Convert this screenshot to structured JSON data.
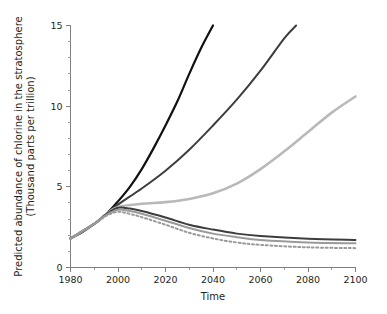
{
  "chart_data": {
    "type": "line",
    "title": "",
    "xlabel": "Time",
    "ylabel": "Predicted abundance of chlorine in the stratosphere (Thousand parts per trillion)",
    "ylabel_line1": "Predicted abundance of chlorine in the stratosphere",
    "ylabel_line2": "(Thousand parts per trillion)",
    "xlim": [
      1980,
      2100
    ],
    "ylim": [
      0,
      15
    ],
    "xticks": [
      1980,
      2000,
      2020,
      2040,
      2060,
      2080,
      2100
    ],
    "xtick_labels": [
      "1980",
      "2000",
      "2020",
      "2040",
      "2060",
      "2080",
      "2100"
    ],
    "xticks_minor": [
      1990,
      2010,
      2030,
      2050,
      2070,
      2090
    ],
    "yticks": [
      0,
      5,
      10,
      15
    ],
    "ytick_labels": [
      "0",
      "5",
      "10",
      "15"
    ],
    "yticks_minor": [
      1,
      2,
      3,
      4,
      6,
      7,
      8,
      9,
      11,
      12,
      13,
      14
    ],
    "grid": false,
    "legend": "none",
    "series": [
      {
        "name": "no-protocol",
        "color": "#111111",
        "width": 2.2,
        "dash": "none",
        "x": [
          1980,
          1985,
          1990,
          1995,
          2000,
          2005,
          2010,
          2015,
          2020,
          2025,
          2030,
          2035,
          2040
        ],
        "values": [
          1.8,
          2.2,
          2.7,
          3.3,
          4.1,
          5.0,
          6.1,
          7.4,
          8.8,
          10.3,
          12.0,
          13.6,
          15.0
        ]
      },
      {
        "name": "no-protocol-lower",
        "color": "#3d3d3d",
        "width": 2.0,
        "dash": "none",
        "x": [
          1980,
          1990,
          1995,
          2000,
          2010,
          2020,
          2030,
          2040,
          2050,
          2060,
          2070,
          2075
        ],
        "values": [
          1.8,
          2.7,
          3.3,
          3.9,
          4.9,
          6.0,
          7.3,
          8.8,
          10.4,
          12.2,
          14.2,
          15.0
        ]
      },
      {
        "name": "montreal-1987",
        "color": "#b9b9b9",
        "width": 2.6,
        "dash": "none",
        "x": [
          1980,
          1990,
          1995,
          2000,
          2010,
          2020,
          2030,
          2040,
          2050,
          2060,
          2070,
          2080,
          2090,
          2100
        ],
        "values": [
          1.8,
          2.7,
          3.3,
          3.75,
          3.95,
          4.05,
          4.25,
          4.6,
          5.2,
          6.1,
          7.2,
          8.4,
          9.6,
          10.6
        ]
      },
      {
        "name": "london-1990",
        "color": "#3d3d3d",
        "width": 2.0,
        "dash": "none",
        "x": [
          1980,
          1990,
          1995,
          2000,
          2005,
          2010,
          2020,
          2030,
          2040,
          2050,
          2060,
          2080,
          2100
        ],
        "values": [
          1.8,
          2.7,
          3.3,
          3.7,
          3.65,
          3.5,
          3.1,
          2.65,
          2.35,
          2.1,
          1.95,
          1.78,
          1.7
        ]
      },
      {
        "name": "copenhagen-1992",
        "color": "#9a9a9a",
        "width": 2.0,
        "dash": "none",
        "x": [
          1980,
          1990,
          1995,
          2000,
          2005,
          2010,
          2020,
          2030,
          2040,
          2050,
          2060,
          2080,
          2100
        ],
        "values": [
          1.8,
          2.7,
          3.25,
          3.58,
          3.5,
          3.33,
          2.9,
          2.45,
          2.1,
          1.88,
          1.7,
          1.55,
          1.5
        ]
      },
      {
        "name": "zero-emissions",
        "color": "#9a9a9a",
        "width": 2.0,
        "dash": "2,2.6",
        "x": [
          1980,
          1990,
          1995,
          2000,
          2005,
          2010,
          2020,
          2030,
          2040,
          2050,
          2060,
          2080,
          2100
        ],
        "values": [
          1.8,
          2.7,
          3.2,
          3.45,
          3.32,
          3.12,
          2.65,
          2.15,
          1.8,
          1.55,
          1.4,
          1.25,
          1.2
        ]
      }
    ]
  }
}
